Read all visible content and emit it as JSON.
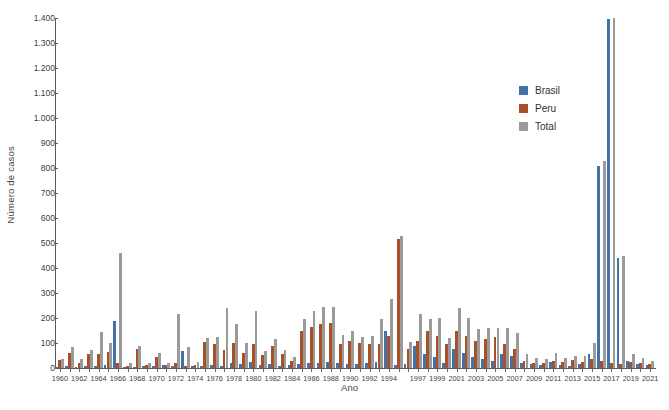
{
  "chart_data": {
    "type": "bar",
    "title": "",
    "xlabel": "Ano",
    "ylabel": "Número de casos",
    "ylim": [
      0,
      1400
    ],
    "ytick_step": 100,
    "ytick_labels": [
      "0",
      "100",
      "200",
      "300",
      "400",
      "500",
      "600",
      "700",
      "800",
      "900",
      "1.000",
      "1.100",
      "1.200",
      "1.300",
      "1.400"
    ],
    "grid": false,
    "legend_position": "inside-upper-right",
    "xtick_labels_every": 2,
    "categories": [
      "1960",
      "1961",
      "1962",
      "1963",
      "1964",
      "1965",
      "1966",
      "1967",
      "1968",
      "1969",
      "1970",
      "1971",
      "1972",
      "1973",
      "1974",
      "1975",
      "1976",
      "1977",
      "1978",
      "1979",
      "1980",
      "1981",
      "1982",
      "1983",
      "1984",
      "1985",
      "1986",
      "1987",
      "1988",
      "1989",
      "1990",
      "1991",
      "1992",
      "1993",
      "1994",
      "1995",
      "1996",
      "1997",
      "1998",
      "1999",
      "2000",
      "2001",
      "2002",
      "2003",
      "2004",
      "2005",
      "2006",
      "2007",
      "2008",
      "2009",
      "2010",
      "2011",
      "2012",
      "2013",
      "2014",
      "2015",
      "2016",
      "2017",
      "2018",
      "2019",
      "2020",
      "2021"
    ],
    "xtick_shown": [
      "1960",
      "1962",
      "1964",
      "1966",
      "1968",
      "1970",
      "1972",
      "1974",
      "1976",
      "1978",
      "1980",
      "1982",
      "1984",
      "1986",
      "1988",
      "1990",
      "1992",
      "1994",
      "1997",
      "1999",
      "2001",
      "2003",
      "2005",
      "2007",
      "2009",
      "2011",
      "2013",
      "2015",
      "2017",
      "2019",
      "2021"
    ],
    "series": [
      {
        "name": "Brasil",
        "color": "#4472a8",
        "values": [
          5,
          8,
          6,
          10,
          8,
          12,
          190,
          6,
          5,
          8,
          10,
          12,
          8,
          70,
          10,
          8,
          12,
          10,
          22,
          15,
          25,
          12,
          15,
          10,
          12,
          18,
          20,
          22,
          25,
          20,
          18,
          15,
          22,
          25,
          150,
          12,
          18,
          90,
          55,
          45,
          20,
          75,
          60,
          45,
          35,
          30,
          55,
          50,
          20,
          15,
          12,
          25,
          12,
          10,
          18,
          55,
          810,
          1395,
          440,
          30,
          18,
          12
        ]
      },
      {
        "name": "Peru",
        "color": "#a85128",
        "values": [
          32,
          60,
          22,
          58,
          55,
          65,
          20,
          10,
          78,
          12,
          45,
          12,
          22,
          10,
          12,
          105,
          95,
          72,
          100,
          62,
          95,
          52,
          88,
          55,
          28,
          150,
          165,
          175,
          180,
          95,
          110,
          100,
          95,
          95,
          130,
          515,
          75,
          110,
          150,
          130,
          95,
          150,
          130,
          110,
          115,
          125,
          95,
          75,
          28,
          20,
          22,
          28,
          25,
          32,
          25,
          35,
          30,
          20,
          18,
          25,
          22,
          15
        ]
      },
      {
        "name": "Total",
        "color": "#9a9a9a",
        "values": [
          38,
          85,
          35,
          72,
          145,
          102,
          460,
          20,
          88,
          22,
          60,
          22,
          215,
          85,
          25,
          122,
          125,
          240,
          175,
          100,
          230,
          70,
          118,
          72,
          45,
          195,
          230,
          245,
          245,
          132,
          150,
          125,
          130,
          195,
          278,
          530,
          105,
          215,
          195,
          200,
          120,
          240,
          200,
          155,
          160,
          160,
          160,
          142,
          55,
          40,
          38,
          62,
          42,
          48,
          48,
          100,
          830,
          1400,
          450,
          58,
          42,
          28
        ]
      }
    ]
  },
  "legend": {
    "items": [
      {
        "label": "Brasil",
        "color": "#4472a8"
      },
      {
        "label": "Peru",
        "color": "#a85128"
      },
      {
        "label": "Total",
        "color": "#9a9a9a"
      }
    ]
  }
}
